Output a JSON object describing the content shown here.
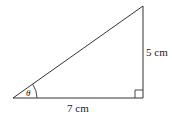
{
  "diagram": {
    "type": "right-triangle",
    "vertices": {
      "bottom_left": [
        13,
        98
      ],
      "bottom_right": [
        143,
        98
      ],
      "top_right": [
        143,
        6
      ]
    },
    "labels": {
      "vertical_side": "5 cm",
      "horizontal_side": "7 cm",
      "angle": "θ"
    },
    "right_angle_marker": true,
    "colors": {
      "stroke": "#333333",
      "text": "#222222"
    }
  }
}
